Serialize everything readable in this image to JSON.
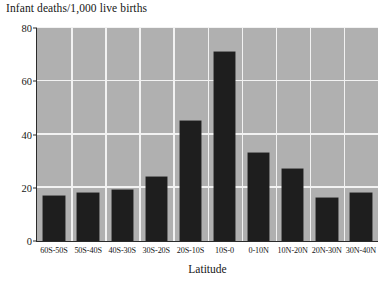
{
  "chart_data": {
    "type": "bar",
    "title": "Infant deaths/1,000 live births",
    "xlabel": "Latitude",
    "ylabel": "",
    "categories": [
      "60S-50S",
      "50S-40S",
      "40S-30S",
      "30S-20S",
      "20S-10S",
      "10S-0",
      "0-10N",
      "10N-20N",
      "20N-30N",
      "30N-40N"
    ],
    "values": [
      17,
      18,
      19,
      24,
      45,
      71,
      33,
      27,
      16,
      18
    ],
    "ylim": [
      0,
      80
    ],
    "yticks": [
      0,
      20,
      40,
      60,
      80
    ],
    "grid": true,
    "legend": "none",
    "series": [
      {
        "name": "Infant deaths per 1,000 live births",
        "values": [
          17,
          18,
          19,
          24,
          45,
          71,
          33,
          27,
          16,
          18
        ]
      }
    ]
  },
  "colors": {
    "bar": "#1e1e1e",
    "plot_background": "#b0b0b0",
    "gridline": "#f2f2f2",
    "page_background": "#ffffff",
    "text": "#161616"
  }
}
